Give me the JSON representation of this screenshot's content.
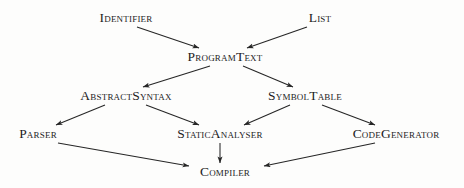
{
  "diagram": {
    "style": {
      "background": "#fdfdfc",
      "text_color": "#1c1c1c",
      "edge_color": "#262626"
    },
    "nodes": [
      {
        "id": "identifier",
        "label": "Identifier",
        "x": 126,
        "y": 18
      },
      {
        "id": "list",
        "label": "List",
        "x": 320,
        "y": 18
      },
      {
        "id": "programtext",
        "label": "ProgramText",
        "x": 225,
        "y": 57
      },
      {
        "id": "abstractsyntax",
        "label": "AbstractSyntax",
        "x": 126,
        "y": 96
      },
      {
        "id": "symboltable",
        "label": "SymbolTable",
        "x": 305,
        "y": 96
      },
      {
        "id": "parser",
        "label": "Parser",
        "x": 38,
        "y": 134
      },
      {
        "id": "staticanalyser",
        "label": "StaticAnalyser",
        "x": 220,
        "y": 134
      },
      {
        "id": "codegenerator",
        "label": "CodeGenerator",
        "x": 396,
        "y": 134
      },
      {
        "id": "compiler",
        "label": "Compiler",
        "x": 225,
        "y": 172
      }
    ],
    "edges": [
      {
        "id": "identifier-to-programtext",
        "from": "Identifier",
        "to": "ProgramText",
        "x1": 137,
        "y1": 27,
        "x2": 199,
        "y2": 48
      },
      {
        "id": "list-to-programtext",
        "from": "List",
        "to": "ProgramText",
        "x1": 307,
        "y1": 27,
        "x2": 247,
        "y2": 48
      },
      {
        "id": "programtext-to-abstractsyntax",
        "from": "ProgramText",
        "to": "AbstractSyntax",
        "x1": 210,
        "y1": 66,
        "x2": 143,
        "y2": 87
      },
      {
        "id": "programtext-to-symboltable",
        "from": "ProgramText",
        "to": "SymbolTable",
        "x1": 243,
        "y1": 66,
        "x2": 293,
        "y2": 87
      },
      {
        "id": "abstractsyntax-to-parser",
        "from": "AbstractSyntax",
        "to": "Parser",
        "x1": 105,
        "y1": 105,
        "x2": 56,
        "y2": 125
      },
      {
        "id": "abstractsyntax-to-staticanalyser",
        "from": "AbstractSyntax",
        "to": "StaticAnalyser",
        "x1": 146,
        "y1": 105,
        "x2": 199,
        "y2": 125
      },
      {
        "id": "symboltable-to-staticanalyser",
        "from": "SymbolTable",
        "to": "StaticAnalyser",
        "x1": 290,
        "y1": 105,
        "x2": 244,
        "y2": 125
      },
      {
        "id": "symboltable-to-codegenerator",
        "from": "SymbolTable",
        "to": "CodeGenerator",
        "x1": 322,
        "y1": 105,
        "x2": 375,
        "y2": 125
      },
      {
        "id": "parser-to-compiler",
        "from": "Parser",
        "to": "Compiler",
        "x1": 58,
        "y1": 143,
        "x2": 189,
        "y2": 166
      },
      {
        "id": "staticanalyser-to-compiler",
        "from": "StaticAnalyser",
        "to": "Compiler",
        "x1": 220,
        "y1": 143,
        "x2": 220,
        "y2": 163
      },
      {
        "id": "codegenerator-to-compiler",
        "from": "CodeGenerator",
        "to": "Compiler",
        "x1": 375,
        "y1": 143,
        "x2": 264,
        "y2": 166
      }
    ]
  }
}
